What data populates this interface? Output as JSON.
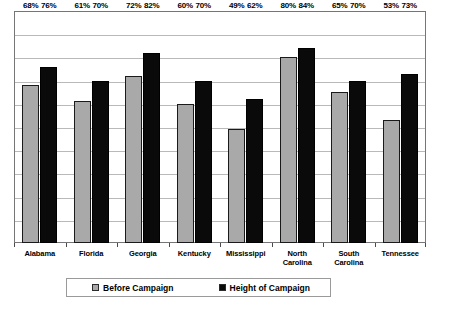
{
  "chart_data": {
    "type": "bar",
    "title": "",
    "subtitle": "",
    "xlabel": "",
    "ylabel": "",
    "ylim": [
      0,
      100
    ],
    "grid": true,
    "y_tick_labels": [],
    "legend_position": "bottom",
    "value_suffix": "%",
    "categories": [
      "Alabama",
      "Florida",
      "Georgia",
      "Kentucky",
      "Mississippi",
      "North\nCarolina",
      "South\nCarolina",
      "Tennessee"
    ],
    "series": [
      {
        "name": "Before Campaign",
        "color": "#a9a9a9",
        "values": [
          68,
          61,
          72,
          60,
          49,
          80,
          65,
          53
        ],
        "labels": [
          "68%",
          "61%",
          "72%",
          "60%",
          "49%",
          "80%",
          "65%",
          "53%"
        ]
      },
      {
        "name": "Height of Campaign",
        "color": "#0a0a0a",
        "values": [
          76,
          70,
          82,
          70,
          62,
          84,
          70,
          73
        ],
        "labels": [
          "76%",
          "70%",
          "82%",
          "70%",
          "62%",
          "84%",
          "70%",
          "73%"
        ]
      }
    ]
  },
  "legend": {
    "items": [
      {
        "label": "Before Campaign",
        "swatch": "legend-swatch-gray"
      },
      {
        "label": "Height of Campaign",
        "swatch": "legend-swatch-black"
      }
    ]
  }
}
